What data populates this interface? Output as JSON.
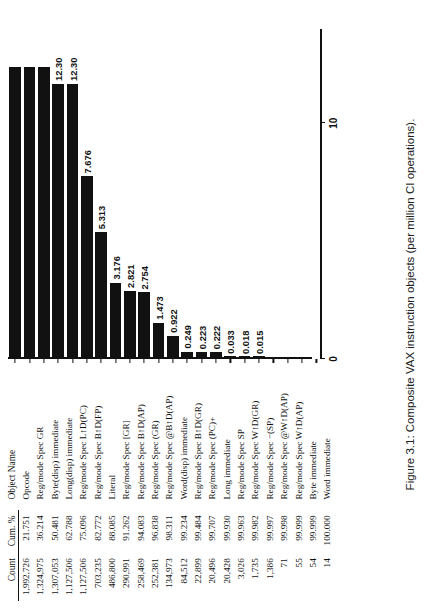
{
  "figure": {
    "caption": "Figure 3.1: Composite VAX instruction objects (per million CI operations)."
  },
  "table": {
    "headers": {
      "count": "Count",
      "cum": "Cum. %",
      "objname": "Object Name"
    }
  },
  "chart_data": {
    "type": "bar",
    "title": "Composite VAX instruction objects (per million CI operations).",
    "xlabel": "Objects (per million CI operations)",
    "ylabel": "Object Name",
    "orientation": "horizontal",
    "xlim": [
      0,
      14
    ],
    "xticks": [
      0,
      10
    ],
    "xticklabels": [
      "0",
      "10"
    ],
    "grid": false,
    "legend": false,
    "categories": [
      "Opcode",
      "Reg/mode Spec GR",
      "Byte(disp) immediate",
      "Long(disp) immediate",
      "Reg/mode Spec L↑D(PC)",
      "Reg/mode Spec B↑D(FP)",
      "Literal",
      "Reg/mode Spec [GR]",
      "Reg/mode Spec B↑D(AP)",
      "Reg/mode Spec (GR)",
      "Reg/mode Spec @B↑D(AP)",
      "Word(disp) immediate",
      "Reg/mode Spec B↑D(GR)",
      "Reg/mode Spec (PC)+",
      "Long immediate",
      "Reg/mode Spec SP",
      "Reg/mode Spec W↑D(GR)",
      "Reg/mode Spec −(SP)",
      "Reg/mode Spec @W↑D(AP)",
      "Reg/mode Spec W↑D(AP)",
      "Byte immediate",
      "Word immediate"
    ],
    "values": [
      12.3,
      12.3,
      12.3,
      11.6,
      11.6,
      11.6,
      7.676,
      5.313,
      3.176,
      2.821,
      2.754,
      1.473,
      0.922,
      0.249,
      0.223,
      0.222,
      0.033,
      0.018,
      0.015,
      0.001,
      0.001,
      0.0
    ],
    "value_labels": [
      "",
      "",
      "",
      "12.30",
      "12.30",
      "",
      "7.676",
      "5.313",
      "3.176",
      "2.821",
      "2.754",
      "1.473",
      "0.922",
      "0.249",
      "0.223",
      "0.222",
      "0.033",
      "0.018",
      "0.015",
      "",
      "",
      ""
    ],
    "counts": [
      "1,992,726",
      "1,324,975",
      "1,307,053",
      "1,127,506",
      "1,127,506",
      "703,235",
      "486,800",
      "290,991",
      "258,469",
      "252,381",
      "134,973",
      "84,512",
      "22,899",
      "20,496",
      "20,428",
      "3,026",
      "1,735",
      "1,386",
      "71",
      "55",
      "54",
      "14"
    ],
    "cumulative_percent": [
      "21.751",
      "36.214",
      "50.481",
      "62.788",
      "75.096",
      "82.772",
      "88.085",
      "91.262",
      "94.083",
      "96.838",
      "98.311",
      "99.234",
      "99.484",
      "99.707",
      "99.930",
      "99.963",
      "99.982",
      "99.997",
      "99.998",
      "99.999",
      "99.999",
      "100.000"
    ]
  },
  "rows": [
    {
      "count": "1,992,726",
      "cum": "21.751",
      "objname": "Opcode",
      "value": 12.3,
      "label": ""
    },
    {
      "count": "1,324,975",
      "cum": "36.214",
      "objname": "Reg/mode Spec GR",
      "value": 12.3,
      "label": ""
    },
    {
      "count": "1,307,053",
      "cum": "50.481",
      "objname": "Byte(disp) immediate",
      "value": 12.3,
      "label": ""
    },
    {
      "count": "1,127,506",
      "cum": "62.788",
      "objname": "Long(disp) immediate",
      "value": 11.6,
      "label": "12.30"
    },
    {
      "count": "1,127,506",
      "cum": "75.096",
      "objname": "Reg/mode Spec L↑D(PC)",
      "value": 11.6,
      "label": "12.30"
    },
    {
      "count": "703,235",
      "cum": "82.772",
      "objname": "Reg/mode Spec B↑D(FP)",
      "value": 7.676,
      "label": "7.676"
    },
    {
      "count": "486,800",
      "cum": "88.085",
      "objname": "Literal",
      "value": 5.313,
      "label": "5.313"
    },
    {
      "count": "290,991",
      "cum": "91.262",
      "objname": "Reg/mode Spec [GR]",
      "value": 3.176,
      "label": "3.176"
    },
    {
      "count": "258,469",
      "cum": "94.083",
      "objname": "Reg/mode Spec B↑D(AP)",
      "value": 2.821,
      "label": "2.821"
    },
    {
      "count": "252,381",
      "cum": "96.838",
      "objname": "Reg/mode Spec (GR)",
      "value": 2.754,
      "label": "2.754"
    },
    {
      "count": "134,973",
      "cum": "98.311",
      "objname": "Reg/mode Spec @B↑D(AP)",
      "value": 1.473,
      "label": "1.473"
    },
    {
      "count": "84,512",
      "cum": "99.234",
      "objname": "Word(disp) immediate",
      "value": 0.922,
      "label": "0.922"
    },
    {
      "count": "22,899",
      "cum": "99.484",
      "objname": "Reg/mode Spec B↑D(GR)",
      "value": 0.249,
      "label": "0.249"
    },
    {
      "count": "20,496",
      "cum": "99.707",
      "objname": "Reg/mode Spec (PC)+",
      "value": 0.223,
      "label": "0.223"
    },
    {
      "count": "20,428",
      "cum": "99.930",
      "objname": "Long immediate",
      "value": 0.222,
      "label": "0.222"
    },
    {
      "count": "3,026",
      "cum": "99.963",
      "objname": "Reg/mode Spec SP",
      "value": 0.033,
      "label": "0.033"
    },
    {
      "count": "1,735",
      "cum": "99.982",
      "objname": "Reg/mode Spec W↑D(GR)",
      "value": 0.018,
      "label": "0.018"
    },
    {
      "count": "1,386",
      "cum": "99.997",
      "objname": "Reg/mode Spec −(SP)",
      "value": 0.015,
      "label": "0.015"
    },
    {
      "count": "71",
      "cum": "99.998",
      "objname": "Reg/mode Spec @W↑D(AP)",
      "value": 0.001,
      "label": ""
    },
    {
      "count": "55",
      "cum": "99.999",
      "objname": "Reg/mode Spec W↑D(AP)",
      "value": 0.001,
      "label": ""
    },
    {
      "count": "54",
      "cum": "99.999",
      "objname": "Byte immediate",
      "value": 0.0,
      "label": ""
    },
    {
      "count": "14",
      "cum": "100.000",
      "objname": "Word immediate",
      "value": 0.0,
      "label": ""
    }
  ],
  "axis": {
    "ticks": [
      {
        "value": 0,
        "label": "0"
      },
      {
        "value": 10,
        "label": "10"
      }
    ]
  }
}
